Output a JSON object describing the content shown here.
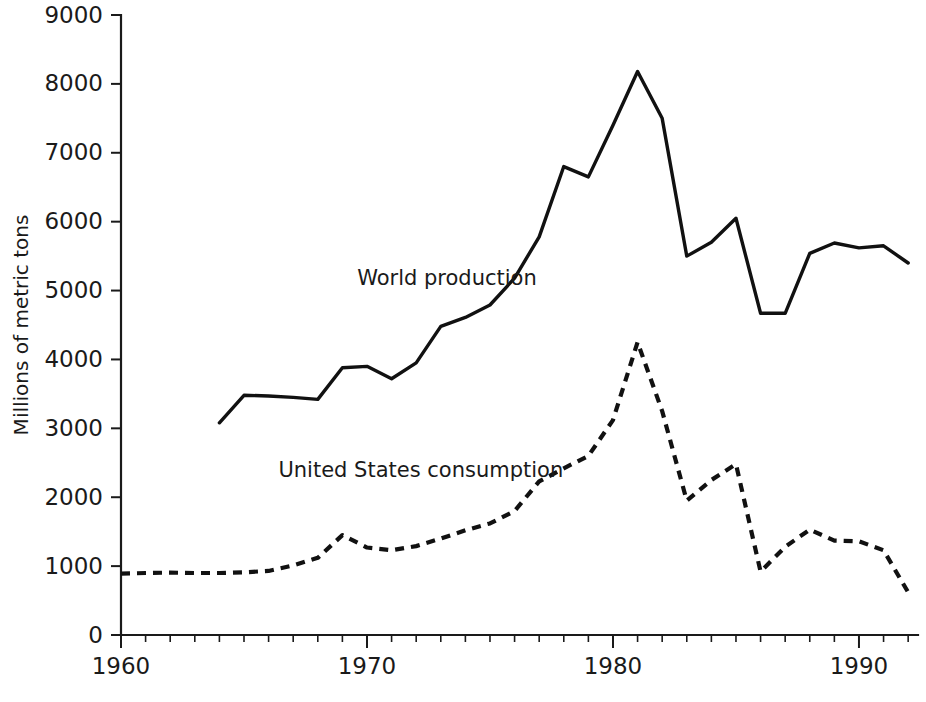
{
  "chart_data": {
    "type": "line",
    "title": "",
    "xlabel": "",
    "ylabel": "Millions of metric tons",
    "xlim": [
      1960,
      1993
    ],
    "ylim": [
      0,
      9000
    ],
    "grid": false,
    "legend_position": "inline-annotations",
    "x_ticks_major": [
      1960,
      1970,
      1980,
      1990
    ],
    "x_tick_labels": [
      "1960",
      "1970",
      "1980",
      "1990"
    ],
    "x_minor_tick_interval": 1,
    "y_ticks": [
      0,
      1000,
      2000,
      3000,
      4000,
      5000,
      6000,
      7000,
      8000,
      9000
    ],
    "y_tick_labels": [
      "0",
      "1000",
      "2000",
      "3000",
      "4000",
      "5000",
      "6000",
      "7000",
      "8000",
      "9000"
    ],
    "series": [
      {
        "name": "World production",
        "style": "solid",
        "label_text": "World production",
        "label_x": 1969.6,
        "label_y": 5080,
        "x": [
          1964,
          1965,
          1966,
          1967,
          1968,
          1969,
          1970,
          1971,
          1972,
          1973,
          1974,
          1975,
          1976,
          1977,
          1978,
          1979,
          1980,
          1981,
          1982,
          1983,
          1984,
          1985,
          1986,
          1987,
          1988,
          1989,
          1990,
          1991,
          1992
        ],
        "values": [
          3080,
          3480,
          3470,
          3450,
          3420,
          3880,
          3900,
          3720,
          3950,
          4480,
          4610,
          4790,
          5180,
          5780,
          6800,
          6650,
          7400,
          8180,
          7500,
          5500,
          5700,
          6050,
          4670,
          4670,
          5540,
          5690,
          5620,
          5650,
          5400
        ]
      },
      {
        "name": "United States consumption",
        "style": "dashed",
        "label_text": "United States consumption",
        "label_x": 1966.4,
        "label_y": 2300,
        "x": [
          1960,
          1961,
          1962,
          1963,
          1964,
          1965,
          1966,
          1967,
          1968,
          1969,
          1970,
          1971,
          1972,
          1973,
          1974,
          1975,
          1976,
          1977,
          1978,
          1979,
          1980,
          1981,
          1982,
          1983,
          1984,
          1985,
          1986,
          1987,
          1988,
          1989,
          1990,
          1991,
          1992
        ],
        "values": [
          890,
          900,
          905,
          900,
          900,
          910,
          930,
          1010,
          1120,
          1450,
          1270,
          1230,
          1290,
          1400,
          1520,
          1620,
          1800,
          2230,
          2420,
          2600,
          3120,
          4250,
          3250,
          1950,
          2250,
          2480,
          920,
          1280,
          1530,
          1370,
          1360,
          1230,
          620
        ]
      }
    ],
    "annotations": [
      {
        "text": "World production",
        "x": 1969.6,
        "y": 5080
      },
      {
        "text": "United States consumption",
        "x": 1966.4,
        "y": 2300
      }
    ]
  },
  "geometry": {
    "plot_left": 121,
    "plot_right": 918,
    "plot_top": 15,
    "plot_bottom": 635,
    "year_min": 1960,
    "year_max": 1992.4
  }
}
